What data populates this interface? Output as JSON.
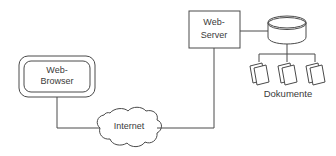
{
  "diagram": {
    "background_color": "#ffffff",
    "stroke_color": "#4a4a4a",
    "text_color": "#3a3a3a",
    "nodes": {
      "browser": {
        "label_line1": "Web-",
        "label_line2": "Browser",
        "shape": "double-rounded-rectangle"
      },
      "internet": {
        "label": "Internet",
        "shape": "cloud"
      },
      "server": {
        "label_line1": "Web-",
        "label_line2": "Server",
        "shape": "rectangle"
      },
      "database": {
        "label": "",
        "shape": "cylinder"
      },
      "documents": {
        "caption": "Dokumente",
        "shape": "document-stack",
        "count": 3
      }
    },
    "connections": [
      {
        "from": "browser",
        "to": "internet"
      },
      {
        "from": "internet",
        "to": "server"
      },
      {
        "from": "server",
        "to": "database"
      },
      {
        "from": "database",
        "to": "documents"
      }
    ]
  }
}
